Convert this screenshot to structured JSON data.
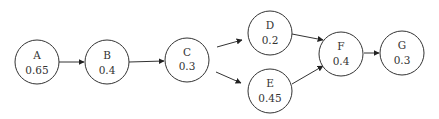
{
  "diagram": {
    "type": "directed-graph",
    "nodes": [
      {
        "id": "A",
        "label": "A",
        "value": "0.65",
        "cx": 37,
        "cy": 62,
        "r": 22
      },
      {
        "id": "B",
        "label": "B",
        "value": "0.4",
        "cx": 107,
        "cy": 62,
        "r": 22
      },
      {
        "id": "C",
        "label": "C",
        "value": "0.3",
        "cx": 187,
        "cy": 60,
        "r": 22
      },
      {
        "id": "D",
        "label": "D",
        "value": "0.2",
        "cx": 270,
        "cy": 33,
        "r": 22
      },
      {
        "id": "E",
        "label": "E",
        "value": "0.45",
        "cx": 270,
        "cy": 95,
        "r": 22
      },
      {
        "id": "F",
        "label": "F",
        "value": "0.4",
        "cx": 347,
        "cy": 74,
        "r": 22
      },
      {
        "id": "G",
        "label": "G",
        "value": "0.3",
        "cx": 402,
        "cy": 70,
        "r": 22
      }
    ],
    "edges": [
      {
        "from": "A",
        "to": "B"
      },
      {
        "from": "B",
        "to": "C"
      },
      {
        "from": "C",
        "to": "D"
      },
      {
        "from": "C",
        "to": "E"
      },
      {
        "from": "D",
        "to": "F"
      },
      {
        "from": "E",
        "to": "F"
      },
      {
        "from": "F",
        "to": "G"
      }
    ],
    "colors": {
      "stroke": "#333333",
      "fill": "#ffffff",
      "text": "#333333"
    }
  }
}
